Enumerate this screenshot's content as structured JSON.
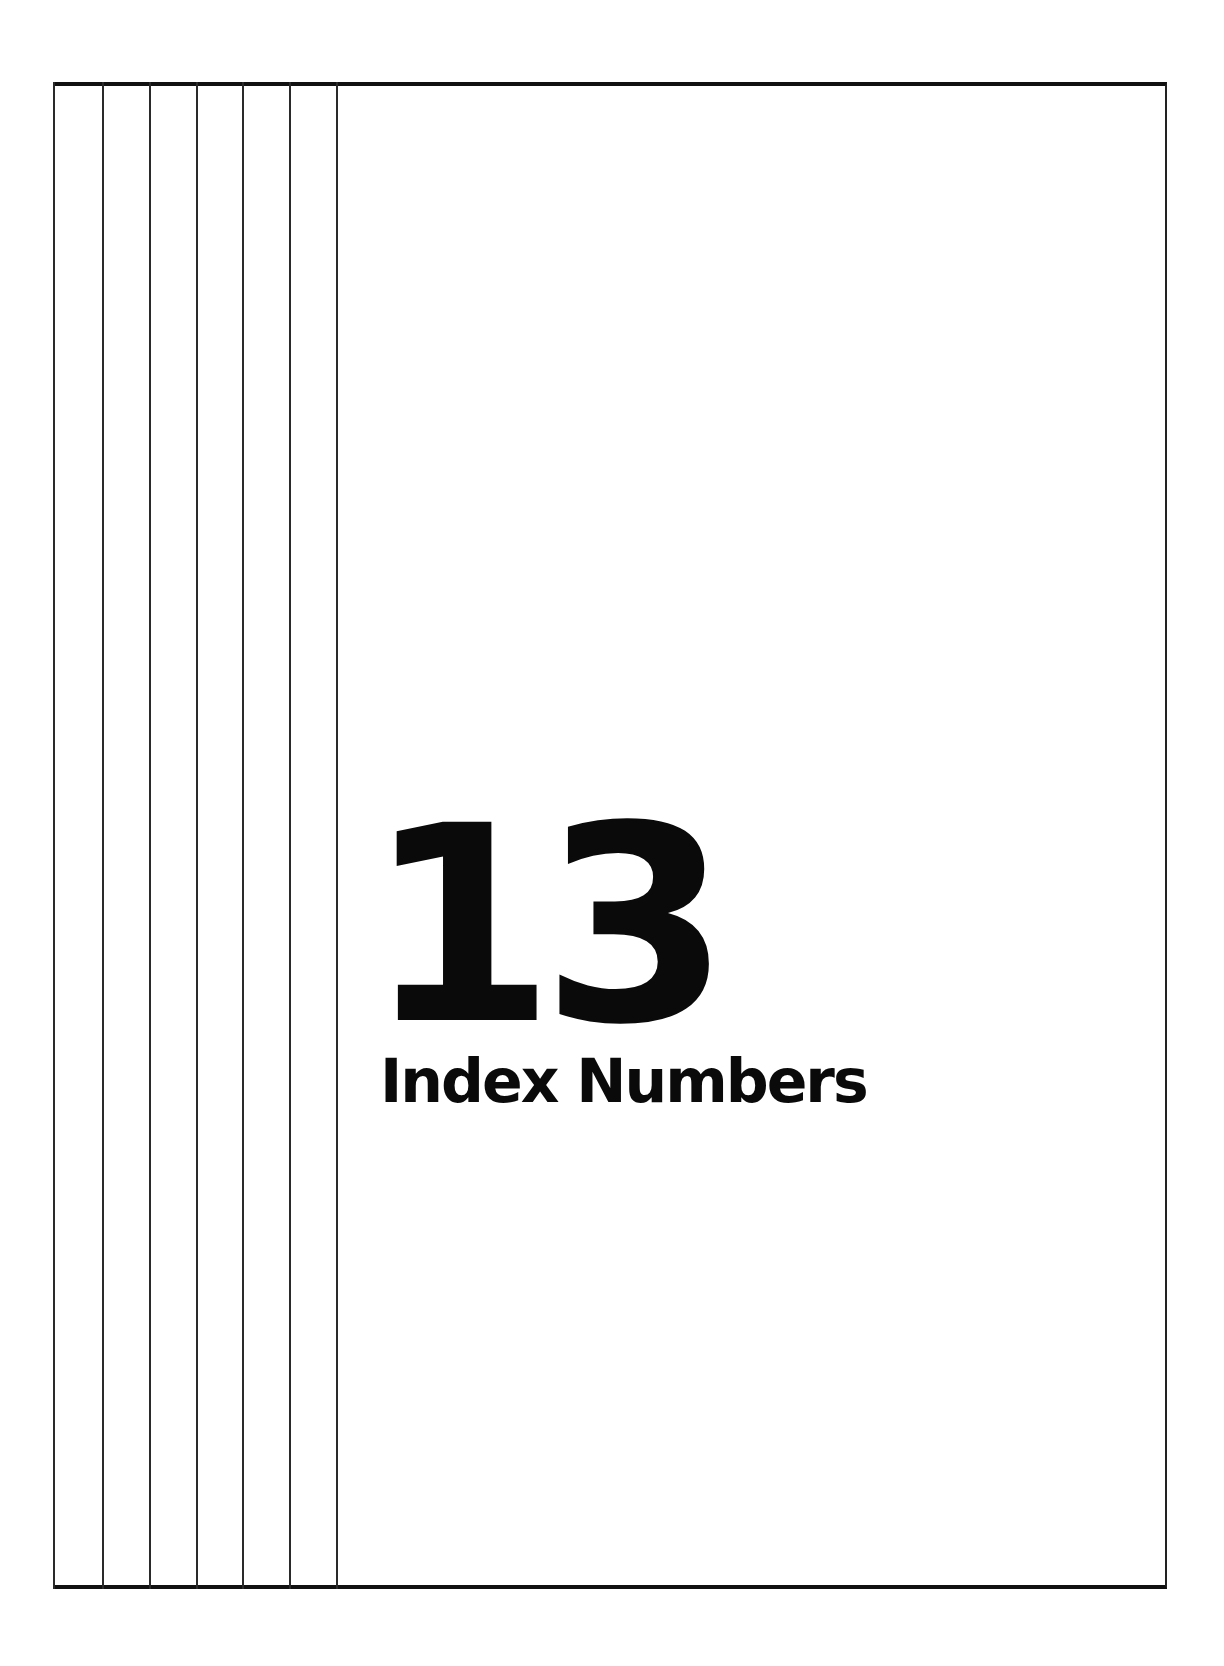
{
  "chapter": {
    "number": "13",
    "title": "Index Numbers"
  },
  "decoration": {
    "rule_color": "#111111",
    "vertical_rule_count": 7
  }
}
